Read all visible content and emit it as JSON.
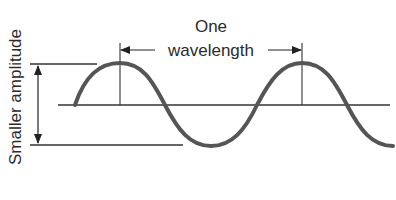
{
  "diagram": {
    "title_partial": "",
    "labels": {
      "top_label": "One",
      "wavelength_label": "wavelength",
      "amplitude_label": "Smaller amplitude"
    },
    "colors": {
      "wave": "#555555",
      "lines": "#333333",
      "text": "#2b2b2b",
      "background": "#ffffff"
    },
    "wave": {
      "baseline_y": 105,
      "crest_y": 63,
      "trough_y": 146,
      "crest_x": [
        120,
        302
      ],
      "wavelength_px": 182,
      "start_x": 75,
      "end_x": 392
    },
    "annotations": {
      "amplitude_arrow": {
        "x": 38,
        "y_top": 65,
        "y_bottom": 144,
        "direction": "double"
      },
      "wavelength_arrow": {
        "x_left": 120,
        "x_right": 302,
        "y": 50,
        "direction": "double"
      },
      "top_reference_line": {
        "y": 64,
        "x_start": 30,
        "x_end": 97
      },
      "bottom_reference_line": {
        "y": 145,
        "x_start": 30,
        "x_end": 183
      }
    }
  }
}
